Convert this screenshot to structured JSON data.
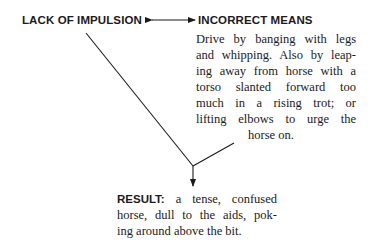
{
  "diagram": {
    "cause": {
      "label": "LACK OF IMPULSION"
    },
    "means": {
      "label": "INCORRECT MEANS",
      "description_lines": [
        "Drive by banging with legs",
        "and whipping. Also by leap-",
        "ing away from horse with a",
        "torso slanted forward too",
        "much in a rising trot; or",
        "lifting elbows to urge the",
        "horse on."
      ]
    },
    "result": {
      "label": "RESULT:",
      "description_lines": [
        " a tense, confused",
        "horse, dull to the aids, pok-",
        "ing around above the bit."
      ]
    },
    "arrows": {
      "bidirectional": "cause <-> means",
      "converging": "cause + means -> result"
    },
    "colors": {
      "ink": "#1a1a1a",
      "background": "#ffffff"
    }
  }
}
